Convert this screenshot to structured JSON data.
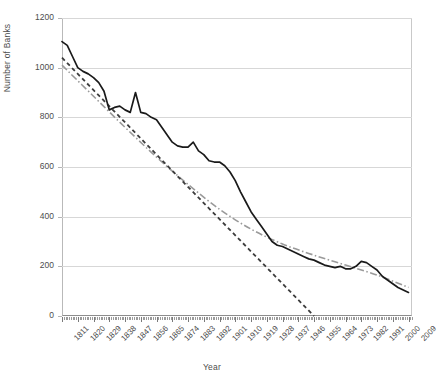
{
  "chart_data": {
    "type": "line",
    "title": "",
    "xlabel": "Year",
    "ylabel": "Number of Banks",
    "xlim": [
      1811,
      2011
    ],
    "ylim": [
      0,
      1200
    ],
    "yticks": [
      0,
      200,
      400,
      600,
      800,
      1000,
      1200
    ],
    "xticks": [
      1811,
      1820,
      1829,
      1838,
      1847,
      1856,
      1865,
      1874,
      1883,
      1892,
      1901,
      1910,
      1919,
      1928,
      1937,
      1946,
      1955,
      1964,
      1973,
      1982,
      1991,
      2000,
      2009
    ],
    "grid": "horizontal",
    "legend": "none",
    "series": [
      {
        "name": "Number of Banks",
        "style": "solid",
        "color": "#1a1a1a",
        "x": [
          1811,
          1814,
          1817,
          1820,
          1823,
          1826,
          1829,
          1832,
          1835,
          1838,
          1841,
          1844,
          1847,
          1850,
          1853,
          1856,
          1859,
          1862,
          1865,
          1868,
          1871,
          1874,
          1877,
          1880,
          1883,
          1886,
          1889,
          1892,
          1895,
          1898,
          1901,
          1904,
          1907,
          1910,
          1913,
          1916,
          1919,
          1922,
          1925,
          1928,
          1931,
          1934,
          1937,
          1940,
          1943,
          1946,
          1949,
          1952,
          1955,
          1958,
          1961,
          1964,
          1967,
          1970,
          1973,
          1976,
          1979,
          1982,
          1985,
          1988,
          1991,
          1994,
          1997,
          2000,
          2003,
          2006,
          2009
        ],
        "y": [
          1105,
          1090,
          1045,
          1000,
          985,
          975,
          960,
          940,
          905,
          830,
          840,
          845,
          830,
          820,
          900,
          820,
          815,
          800,
          790,
          760,
          730,
          700,
          685,
          680,
          680,
          700,
          665,
          650,
          625,
          620,
          620,
          605,
          580,
          545,
          500,
          460,
          420,
          390,
          360,
          330,
          300,
          285,
          280,
          270,
          260,
          250,
          240,
          230,
          225,
          215,
          205,
          200,
          195,
          200,
          190,
          190,
          200,
          220,
          215,
          200,
          185,
          160,
          145,
          130,
          115,
          105,
          95
        ]
      },
      {
        "name": "Linear trend",
        "style": "dashed",
        "color": "#3c3c3c",
        "x": [
          1811,
          1955
        ],
        "y": [
          1040,
          0
        ]
      },
      {
        "name": "Power trend",
        "style": "dash-dot",
        "color": "#9a9a9a",
        "x": [
          1811,
          1829,
          1847,
          1865,
          1883,
          1901,
          1919,
          1937,
          1955,
          1973,
          1991,
          2009
        ],
        "y": [
          1010,
          885,
          760,
          640,
          530,
          430,
          350,
          290,
          245,
          205,
          165,
          115
        ]
      }
    ]
  },
  "axes": {
    "y_title": "Number of Banks",
    "x_title": "Year",
    "y_labels": [
      "1200",
      "1000",
      "800",
      "600",
      "400",
      "200",
      "0"
    ],
    "x_labels": [
      "1811",
      "1820",
      "1829",
      "1838",
      "1847",
      "1856",
      "1865",
      "1874",
      "1883",
      "1892",
      "1901",
      "1910",
      "1919",
      "1928",
      "1937",
      "1946",
      "1955",
      "1964",
      "1973",
      "1982",
      "1991",
      "2000",
      "2009"
    ]
  },
  "colors": {
    "data_line": "#1a1a1a",
    "linear_trend": "#3c3c3c",
    "power_trend": "#9a9a9a",
    "gridline": "#d7d7d7",
    "axis": "#8d8d8d",
    "text": "#4d4d4d"
  }
}
